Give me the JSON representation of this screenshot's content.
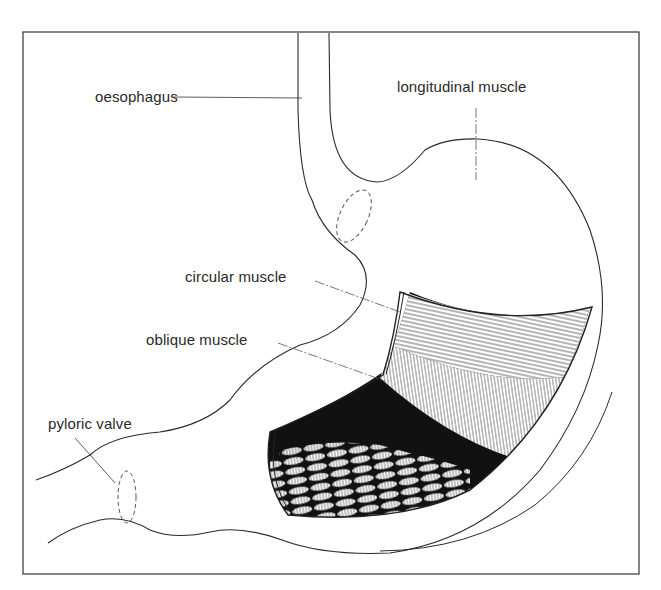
{
  "figure": {
    "type": "anatomical illustration",
    "colors": {
      "ink": "#2a2a2a",
      "background": "#ffffff",
      "dark_fill": "#111111"
    },
    "labels": [
      {
        "id": "oesophagus",
        "text": "oesophagus"
      },
      {
        "id": "longitudinal",
        "text": "longitudinal muscle"
      },
      {
        "id": "circular",
        "text": "circular muscle"
      },
      {
        "id": "oblique",
        "text": "oblique muscle"
      },
      {
        "id": "pyloric",
        "text": "pyloric valve"
      }
    ]
  }
}
